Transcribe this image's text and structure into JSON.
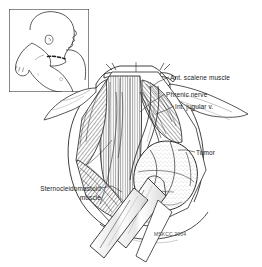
{
  "figure": {
    "credit": "MSKCC 2004",
    "background_color": "#ffffff",
    "ink_color": "#1a1a1a"
  },
  "inset": {
    "name": "patient-positioning-inset",
    "description": "Line drawing of an infant supine with the head turned to the side and the shoulder elevated, showing the planned transverse cervical incision marked with a dashed line",
    "border_color": "#2b2b2b",
    "incision_style": "dashed"
  },
  "labels": [
    {
      "id": "ant-scalene-muscle",
      "text": "Ant. scalene muscle",
      "x": 170,
      "y": 74,
      "align": "left"
    },
    {
      "id": "phrenic-nerve",
      "text": "Phrenic nerve",
      "x": 166,
      "y": 91,
      "align": "left"
    },
    {
      "id": "int-jugular-vein",
      "text": "Int. jugular v.",
      "x": 175,
      "y": 103,
      "align": "left"
    },
    {
      "id": "tumor",
      "text": "Tumor",
      "x": 196,
      "y": 149,
      "align": "left"
    },
    {
      "id": "sternocleidomastoid-muscle",
      "text": "Sternocleidomastoid\nmuscle",
      "x": 13,
      "y": 185,
      "align": "right",
      "width": 88
    }
  ],
  "anatomy": {
    "structures": [
      "anterior scalene muscle",
      "phrenic nerve",
      "internal jugular vein",
      "sternocleidomastoid muscle",
      "tumor mass",
      "clavicle",
      "skin flaps"
    ],
    "instruments": [
      "self-retaining retractor blades",
      "retractor hooks",
      "vessel loop"
    ]
  }
}
